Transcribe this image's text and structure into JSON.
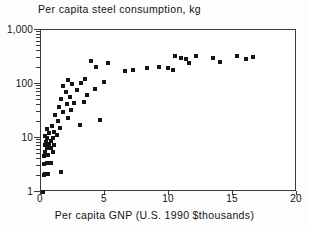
{
  "chart_data": {
    "type": "scatter",
    "title": "Per capita steel consumption, kg",
    "xlabel": "Per capita GNP (U.S. 1990 $thousands)",
    "ylabel": "",
    "xscale": "linear",
    "yscale": "log",
    "xlim": [
      0,
      20
    ],
    "ylim": [
      1,
      1000
    ],
    "grid": false,
    "legend": null,
    "marker": "filled-square",
    "marker_color": "#151515",
    "xticks": [
      0,
      5,
      10,
      15,
      20
    ],
    "xtick_labels": [
      "0",
      "5",
      "10",
      "15",
      "20"
    ],
    "yticks": [
      1,
      10,
      100,
      1000
    ],
    "ytick_labels": [
      "1",
      "10",
      "100",
      "1,000"
    ],
    "yminor_ticks": [
      2,
      3,
      4,
      5,
      6,
      7,
      8,
      9,
      20,
      30,
      40,
      50,
      60,
      70,
      80,
      90,
      200,
      300,
      400,
      500,
      600,
      700,
      800,
      900
    ],
    "points": [
      [
        0.15,
        1.0
      ],
      [
        0.2,
        2.1
      ],
      [
        0.35,
        2.2
      ],
      [
        0.55,
        2.2
      ],
      [
        1.55,
        2.3
      ],
      [
        0.2,
        3.3
      ],
      [
        0.45,
        3.4
      ],
      [
        0.8,
        3.5
      ],
      [
        0.25,
        4.6
      ],
      [
        0.55,
        4.8
      ],
      [
        0.3,
        5.6
      ],
      [
        0.9,
        5.4
      ],
      [
        0.45,
        6.4
      ],
      [
        0.75,
        6.6
      ],
      [
        0.3,
        7.3
      ],
      [
        0.6,
        7.6
      ],
      [
        1.0,
        7.4
      ],
      [
        0.4,
        8.6
      ],
      [
        0.8,
        8.8
      ],
      [
        0.5,
        9.9
      ],
      [
        0.95,
        10.2
      ],
      [
        0.35,
        11.0
      ],
      [
        1.25,
        11.5
      ],
      [
        0.6,
        12.6
      ],
      [
        1.05,
        13.0
      ],
      [
        0.5,
        14.5
      ],
      [
        1.45,
        15.0
      ],
      [
        0.85,
        16.5
      ],
      [
        3.05,
        17.5
      ],
      [
        1.3,
        21.0
      ],
      [
        2.1,
        23.0
      ],
      [
        4.6,
        22.0
      ],
      [
        1.1,
        27.0
      ],
      [
        1.75,
        30.0
      ],
      [
        2.35,
        33.0
      ],
      [
        1.4,
        38.0
      ],
      [
        2.0,
        42.0
      ],
      [
        2.6,
        45.0
      ],
      [
        3.35,
        47.0
      ],
      [
        1.6,
        52.0
      ],
      [
        2.25,
        58.0
      ],
      [
        3.6,
        62.0
      ],
      [
        1.95,
        72.0
      ],
      [
        2.8,
        78.0
      ],
      [
        4.2,
        80.0
      ],
      [
        1.7,
        90.0
      ],
      [
        2.45,
        98.0
      ],
      [
        3.1,
        105.0
      ],
      [
        4.95,
        110.0
      ],
      [
        2.1,
        118.0
      ],
      [
        3.45,
        125.0
      ],
      [
        6.6,
        175.0
      ],
      [
        7.2,
        185.0
      ],
      [
        8.3,
        200.0
      ],
      [
        9.2,
        205.0
      ],
      [
        9.9,
        195.0
      ],
      [
        10.3,
        185.0
      ],
      [
        10.5,
        330.0
      ],
      [
        10.9,
        300.0
      ],
      [
        11.3,
        290.0
      ],
      [
        11.6,
        250.0
      ],
      [
        12.1,
        330.0
      ],
      [
        13.4,
        300.0
      ],
      [
        14.0,
        260.0
      ],
      [
        15.3,
        330.0
      ],
      [
        16.0,
        290.0
      ],
      [
        16.6,
        320.0
      ],
      [
        3.9,
        270.0
      ],
      [
        4.3,
        210.0
      ],
      [
        5.2,
        250.0
      ]
    ]
  }
}
